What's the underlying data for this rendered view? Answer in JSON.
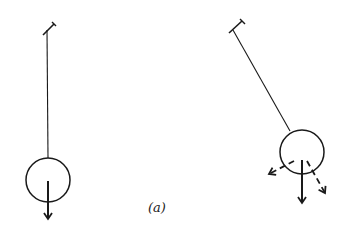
{
  "figure": {
    "caption": "(a)",
    "stroke_color": "#1a1a1a",
    "pendulums": [
      {
        "id": "vertical-pendulum",
        "state": "at rest, hanging vertically",
        "pivot": [
          47,
          28
        ],
        "bob_center": [
          48,
          180
        ],
        "bob_radius": 22,
        "forces": [
          {
            "name": "weight",
            "style": "solid",
            "direction": "down"
          }
        ]
      },
      {
        "id": "displaced-pendulum",
        "state": "displaced at an angle",
        "pivot": [
          235,
          27
        ],
        "bob_center": [
          302,
          152
        ],
        "bob_radius": 22,
        "forces": [
          {
            "name": "weight",
            "style": "solid",
            "direction": "down"
          },
          {
            "name": "tangential-component",
            "style": "dashed",
            "direction": "down-left"
          },
          {
            "name": "radial-component",
            "style": "dashed",
            "direction": "down-right"
          }
        ]
      }
    ]
  }
}
